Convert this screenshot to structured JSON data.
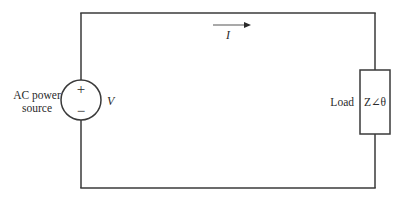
{
  "diagram": {
    "type": "circuit",
    "title": "",
    "source": {
      "label_line1": "AC power",
      "label_line2": "source",
      "voltage_symbol": "V",
      "plus_sign": "+",
      "minus_sign": "−"
    },
    "current": {
      "symbol": "I",
      "direction": "right"
    },
    "load": {
      "label": "Load",
      "impedance": "Z∠θ"
    },
    "colors": {
      "wire": "#3a3a3a",
      "text": "#2a2a2a",
      "arrow": "#7a7a7a",
      "background": "#ffffff"
    }
  }
}
